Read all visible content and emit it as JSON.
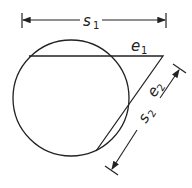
{
  "diagram": {
    "labels": {
      "s1": "s",
      "s1_sub": "1",
      "e1": "e",
      "e1_sub": "1",
      "e2": "e",
      "e2_sub": "2",
      "s2": "s",
      "s2_sub": "2"
    },
    "stroke_color": "#222222"
  }
}
